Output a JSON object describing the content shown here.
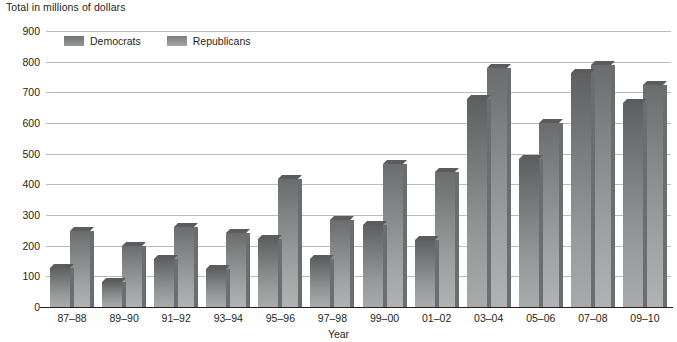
{
  "chart_data": {
    "type": "bar",
    "title": "",
    "unit_label": "Total in millions of dollars",
    "xlabel": "Year",
    "ylabel": "",
    "ylim": [
      0,
      900
    ],
    "ytick_step": 100,
    "yticks": [
      900,
      800,
      700,
      600,
      500,
      400,
      300,
      200,
      100,
      0
    ],
    "grid": true,
    "legend_position": "top-left",
    "categories": [
      "87–88",
      "89–90",
      "91–92",
      "93–94",
      "95–96",
      "97–98",
      "99–00",
      "01–02",
      "03–04",
      "05–06",
      "07–08",
      "09–10"
    ],
    "series": [
      {
        "name": "Democrats",
        "color": "#8a8c8e",
        "values": [
          127,
          80,
          158,
          125,
          222,
          156,
          268,
          218,
          678,
          483,
          762,
          665
        ]
      },
      {
        "name": "Republicans",
        "color": "#9a9c9e",
        "values": [
          248,
          200,
          262,
          240,
          417,
          285,
          465,
          441,
          780,
          600,
          790,
          723
        ]
      }
    ]
  },
  "legend": {
    "items": [
      {
        "label": "Democrats",
        "swatch": "dem-swatch"
      },
      {
        "label": "Republicans",
        "swatch": "rep-swatch"
      }
    ]
  },
  "colors": {
    "gridline": "#b9bbbd",
    "axis": "#231f20",
    "text": "#231f20",
    "background": "#ffffff"
  }
}
